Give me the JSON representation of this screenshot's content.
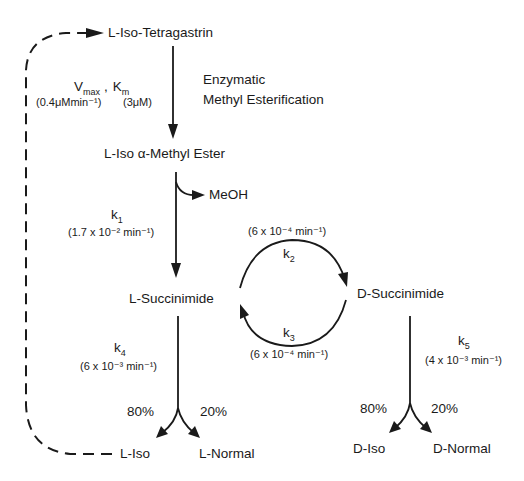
{
  "diagram": {
    "type": "reaction-scheme",
    "nodes": {
      "l_iso_tetragastrin": "L-Iso-Tetragastrin",
      "l_iso_methyl_ester": "L-Iso α-Methyl Ester",
      "l_succinimide": "L-Succinimide",
      "d_succinimide": "D-Succinimide",
      "l_iso": "L-Iso",
      "l_normal": "L-Normal",
      "d_iso": "D-Iso",
      "d_normal": "D-Normal",
      "meoh": "MeOH"
    },
    "step1": {
      "vmax": "V",
      "vmax_sub": "max",
      "comma": ",",
      "km": "K",
      "km_sub": "m",
      "vmax_value": "(0.4μMmin⁻¹)",
      "km_value": "(3μM)",
      "description_line1": "Enzymatic",
      "description_line2": "Methyl Esterification"
    },
    "k1": {
      "symbol": "k",
      "sub": "1",
      "value": "(1.7 x 10⁻² min⁻¹)"
    },
    "k2": {
      "symbol": "k",
      "sub": "2",
      "value": "(6 x 10⁻⁴ min⁻¹)"
    },
    "k3": {
      "symbol": "k",
      "sub": "3",
      "value": "(6 x 10⁻⁴ min⁻¹)"
    },
    "k4": {
      "symbol": "k",
      "sub": "4",
      "value": "(6 x 10⁻³ min⁻¹)"
    },
    "k5": {
      "symbol": "k",
      "sub": "5",
      "value": "(4 x 10⁻³ min⁻¹)"
    },
    "l_branch": {
      "iso_pct": "80%",
      "normal_pct": "20%"
    },
    "d_branch": {
      "iso_pct": "80%",
      "normal_pct": "20%"
    }
  }
}
